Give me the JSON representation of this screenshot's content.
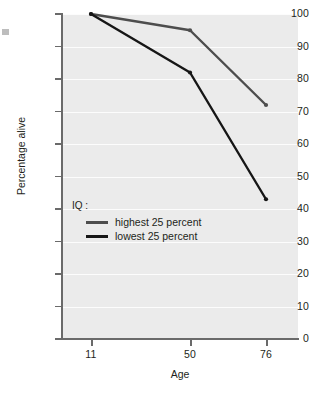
{
  "chart_data": {
    "type": "line",
    "title": "",
    "xlabel": "Age",
    "ylabel": "Percentage alive",
    "x": [
      11,
      50,
      76
    ],
    "categories": [
      "11",
      "50",
      "76"
    ],
    "xtick_labels": [
      "11",
      "50",
      "76"
    ],
    "ytick_labels": [
      "0",
      "10",
      "20",
      "30",
      "40",
      "50",
      "60",
      "70",
      "80",
      "90",
      "100"
    ],
    "ytick_values": [
      0,
      10,
      20,
      30,
      40,
      50,
      60,
      70,
      80,
      90,
      100
    ],
    "ylim": [
      0,
      100
    ],
    "xlim": [
      0,
      100
    ],
    "grid": "horizontal",
    "legend_position": "inside-lower-left",
    "legend_title": "IQ :",
    "series": [
      {
        "name": "highest 25 percent",
        "values": [
          100,
          95,
          72
        ],
        "color": "#4d4d4d"
      },
      {
        "name": "lowest 25 percent",
        "values": [
          100,
          82,
          43
        ],
        "color": "#161616"
      }
    ],
    "colors": {
      "panel_background": "#ebebeb",
      "gridline": "#fcfcfc",
      "axis": "#6a6a6a",
      "text": "#231f20",
      "page_background": "#ffffff"
    }
  }
}
